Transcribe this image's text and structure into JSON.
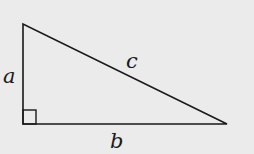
{
  "diagram": {
    "background": "#ebebeb",
    "stroke": "#1a1a1a",
    "vertices": {
      "top": [
        23,
        24
      ],
      "right_angle": [
        23,
        124
      ],
      "right": [
        227,
        124
      ]
    },
    "labels": {
      "side_a": "a",
      "side_b": "b",
      "side_c": "c"
    },
    "right_angle_marker": "square"
  }
}
